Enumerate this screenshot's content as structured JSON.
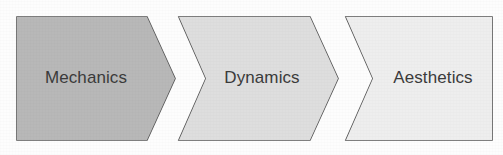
{
  "diagram": {
    "type": "process-chevron-flow",
    "title": "",
    "background_color": "#fdfdfd",
    "border_color": "#565656",
    "text_color": "#3b3b3b",
    "stages": [
      {
        "label": "Mechanics",
        "order": 1,
        "fill_color": "#b8b8b8",
        "shape": "arrow-right-flat-start",
        "points": "17,17 147,17 175,78.5 147,140 17,140",
        "label_x": 86,
        "label_y": 79
      },
      {
        "label": "Dynamics",
        "order": 2,
        "fill_color": "#dedede",
        "shape": "chevron",
        "points": "179,17 310,17 338,78.5 310,140 179,140 206,78.5",
        "label_x": 262,
        "label_y": 79
      },
      {
        "label": "Aesthetics",
        "order": 3,
        "fill_color": "#eeeeee",
        "shape": "chevron-flat-end",
        "points": "346,17 492,17 492,140 346,140 373,78.5",
        "label_x": 433,
        "label_y": 79
      }
    ]
  }
}
